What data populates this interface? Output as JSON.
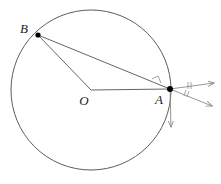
{
  "figure": {
    "background_color": "#ffffff",
    "stroke_color": "#4a4a4a",
    "ray_color": "#8a8a8a",
    "point_color": "#000000",
    "label_color": "#1a1a1a"
  },
  "circle": {
    "name": "main-circle",
    "center_x": 91,
    "center_y": 90,
    "radius": 80,
    "stroke_width": 0.9
  },
  "points": [
    {
      "id": "B",
      "label": "B",
      "x": 38,
      "y": 35,
      "label_x": 24,
      "label_y": 33,
      "dot_radius": 2.6
    },
    {
      "id": "O",
      "label": "O",
      "x": 91,
      "y": 90,
      "label_x": 84,
      "label_y": 105,
      "dot_radius": 0
    },
    {
      "id": "A",
      "label": "A",
      "x": 170,
      "y": 89,
      "label_x": 159,
      "label_y": 104,
      "dot_radius": 3.0
    }
  ],
  "segments": [
    {
      "id": "chord-BA",
      "x1": 38,
      "y1": 35,
      "x2": 170,
      "y2": 89
    },
    {
      "id": "radius-OB",
      "x1": 38,
      "y1": 35,
      "x2": 91,
      "y2": 90
    },
    {
      "id": "radius-OA",
      "x1": 91,
      "y1": 90,
      "x2": 170,
      "y2": 89
    }
  ],
  "right_angle_mark": {
    "id": "right-angle-at-A",
    "points": "152,79 158,76 161,83"
  },
  "rays": [
    {
      "id": "ray-upper-right",
      "x1": 170,
      "y1": 89,
      "x2": 214,
      "y2": 83,
      "arrow": true
    },
    {
      "id": "ray-lower-right",
      "x1": 170,
      "y1": 89,
      "x2": 212,
      "y2": 106,
      "arrow": true
    },
    {
      "id": "ray-downward",
      "x1": 170,
      "y1": 89,
      "x2": 171,
      "y2": 127,
      "arrow": true
    }
  ],
  "angle_ticks": [
    {
      "id": "tick-upper-1",
      "x1": 188,
      "y1": 82,
      "x2": 188,
      "y2": 89
    },
    {
      "id": "tick-upper-2",
      "x1": 191,
      "y1": 82,
      "x2": 191,
      "y2": 89
    },
    {
      "id": "tick-lower-1",
      "x1": 186,
      "y1": 90,
      "x2": 184,
      "y2": 96
    },
    {
      "id": "tick-lower-2",
      "x1": 189,
      "y1": 91,
      "x2": 187,
      "y2": 97
    }
  ]
}
